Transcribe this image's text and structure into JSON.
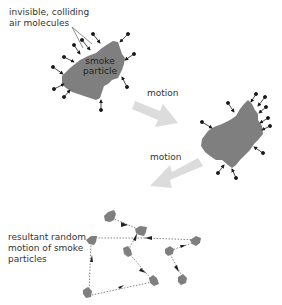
{
  "labels": {
    "molecules_line1": "invisible, colliding",
    "molecules_line2": "air molecules",
    "particle_line1": "smoke",
    "particle_line2": "particle",
    "motion_1": "motion",
    "motion_2": "motion",
    "resultant_line1": "resultant random",
    "resultant_line2": "motion of smoke",
    "resultant_line3": "particles"
  },
  "colors": {
    "particle": "#7f7f7f",
    "molecule": "#1a1a1a",
    "motion_arrow": "#dcdcdc",
    "path": "#555555",
    "text": "#333333"
  }
}
